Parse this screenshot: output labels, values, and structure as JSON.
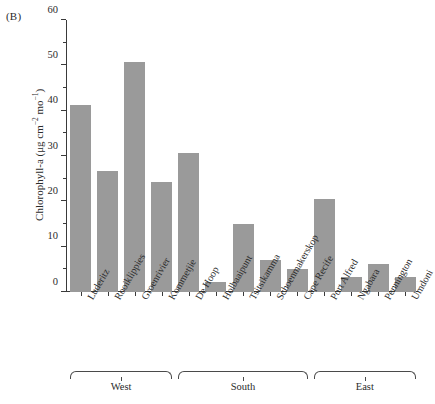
{
  "panel": {
    "label": "(B)"
  },
  "chart_data": {
    "type": "bar",
    "title": "",
    "subtitle": "",
    "xlabel": "",
    "ylabel": "Chlorophyll-a (μg cm−2 mo−1)",
    "ylabel_parts": {
      "prefix": "Chlorophyll-a (μg cm",
      "sup1": "−2",
      "mid": " mo",
      "sup2": "−1",
      "suffix": ")"
    },
    "ylim": [
      0,
      60
    ],
    "yticks": [
      0,
      10,
      20,
      30,
      40,
      50,
      60
    ],
    "ytick_labels": [
      "0",
      "10",
      "20",
      "30",
      "40",
      "50",
      "60"
    ],
    "yminor_ticks": [
      5,
      15,
      25,
      35,
      45,
      55
    ],
    "grid": false,
    "legend": null,
    "bar_color": "#9a9a9a",
    "axis_color": "#3a3a3a",
    "categories": [
      "Luderitz",
      "Rooiklippies",
      "Groenrivier",
      "Kommetjie",
      "De Hoop",
      "Holbaaipunt",
      "Tsitsikamma",
      "Schoenmakerskop",
      "Cape Recife",
      "Port Alfred",
      "Ngabara",
      "Pennington",
      "Umdoni"
    ],
    "values": [
      41.2,
      26.8,
      50.7,
      24.2,
      30.6,
      2.2,
      14.9,
      7.0,
      5.0,
      20.5,
      3.3,
      6.2,
      3.3
    ],
    "groups": [
      {
        "label": "West",
        "start": 0,
        "end": 3
      },
      {
        "label": "South",
        "start": 4,
        "end": 8
      },
      {
        "label": "East",
        "start": 9,
        "end": 12
      }
    ]
  }
}
